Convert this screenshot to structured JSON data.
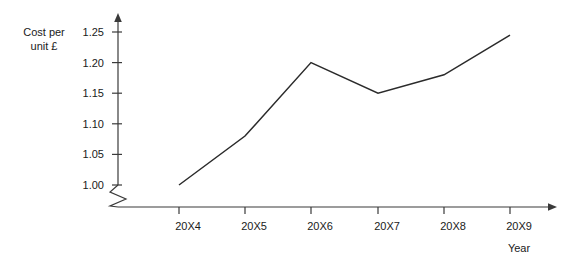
{
  "chart_data": {
    "type": "line",
    "title": "",
    "xlabel": "Year",
    "ylabel": "Cost per unit £",
    "ylabel_lines": [
      "Cost per",
      "unit £"
    ],
    "categories": [
      "20X4",
      "20X5",
      "20X6",
      "20X7",
      "20X8",
      "20X9"
    ],
    "values": [
      1.0,
      1.08,
      1.2,
      1.15,
      1.18,
      1.245
    ],
    "series": [
      {
        "name": "Cost per unit",
        "values": [
          1.0,
          1.08,
          1.2,
          1.15,
          1.18,
          1.245
        ]
      }
    ],
    "ytick_labels": [
      "1.00",
      "1.05",
      "1.10",
      "1.15",
      "1.20",
      "1.25"
    ],
    "ytick_values": [
      1.0,
      1.05,
      1.1,
      1.15,
      1.2,
      1.25
    ],
    "ylim": [
      1.0,
      1.25
    ],
    "y_axis_break": true,
    "grid": false,
    "legend": false,
    "legend_position": "none",
    "line_color": "#2b2b2b",
    "axis_color": "#3a3a3a",
    "background_color": "#ffffff"
  }
}
